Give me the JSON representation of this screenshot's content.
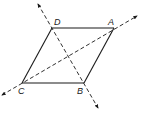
{
  "diagram": {
    "type": "geometry",
    "shape": "parallelogram",
    "stroke_color": "#1a1a1a",
    "background": "#ffffff",
    "vertices": [
      {
        "name": "A",
        "x": 114,
        "y": 28,
        "label_x": 108,
        "label_y": 25
      },
      {
        "name": "B",
        "x": 84,
        "y": 83,
        "label_x": 77,
        "label_y": 94
      },
      {
        "name": "C",
        "x": 22,
        "y": 83,
        "label_x": 18,
        "label_y": 94
      },
      {
        "name": "D",
        "x": 52,
        "y": 28,
        "label_x": 54,
        "label_y": 25
      }
    ],
    "sides": [
      {
        "from": "A",
        "to": "B"
      },
      {
        "from": "B",
        "to": "C"
      },
      {
        "from": "C",
        "to": "D"
      },
      {
        "from": "D",
        "to": "A"
      }
    ],
    "diagonal_lines": [
      {
        "name": "line-DB",
        "through": [
          "D",
          "B"
        ],
        "style": "dashed",
        "arrows": "both",
        "x1": 38,
        "y1": 4,
        "x2": 98,
        "y2": 108
      },
      {
        "name": "line-CA",
        "through": [
          "C",
          "A"
        ],
        "style": "dashed",
        "arrows": "both",
        "x1": 2,
        "y1": 95,
        "x2": 137,
        "y2": 16
      }
    ]
  }
}
